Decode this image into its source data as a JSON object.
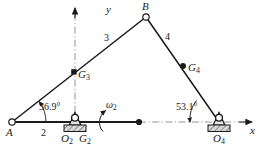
{
  "figure": {
    "type": "fourbar-linkage-kinematic-diagram",
    "axes": {
      "x_label": "x",
      "y_label": "y"
    },
    "joints": [
      {
        "id": "A",
        "label": "A",
        "kind": "pin-joint",
        "x": 12,
        "y": 122
      },
      {
        "id": "B",
        "label": "B",
        "kind": "pin-joint",
        "x": 146,
        "y": 17
      },
      {
        "id": "O2",
        "label": "O",
        "sub": "2",
        "kind": "ground-pivot",
        "x": 75,
        "y": 122
      },
      {
        "id": "O4",
        "label": "O",
        "sub": "4",
        "kind": "ground-pivot",
        "x": 219,
        "y": 122
      }
    ],
    "links": [
      {
        "id": "link2",
        "label": "2",
        "from": "A",
        "to": "O2"
      },
      {
        "id": "link3",
        "label": "3",
        "from": "A",
        "to": "B"
      },
      {
        "id": "link4",
        "label": "4",
        "from": "B",
        "to": "O4"
      }
    ],
    "mass_centers": [
      {
        "id": "G2",
        "label": "G",
        "sub": "2",
        "marker": "pivot",
        "x": 75,
        "y": 122
      },
      {
        "id": "G3",
        "label": "G",
        "sub": "3",
        "marker": "square",
        "x": 74,
        "y": 72
      },
      {
        "id": "G4",
        "label": "G",
        "sub": "4",
        "marker": "dot",
        "x": 183,
        "y": 66
      }
    ],
    "angles": [
      {
        "id": "theta2",
        "label": "36.9°",
        "at": "A",
        "value": 36.9
      },
      {
        "id": "theta4",
        "label": "53.1°",
        "at": "O4",
        "value": 53.1
      }
    ],
    "omega": {
      "label": "ω",
      "sub": "2",
      "description": "angular-velocity-of-crank"
    },
    "colors": {
      "line": "#1a1a1a",
      "ground_hatch": "#555555",
      "centerline": "#8a8a8a",
      "text": "#1a1a1a",
      "background": "#ffffff"
    }
  }
}
